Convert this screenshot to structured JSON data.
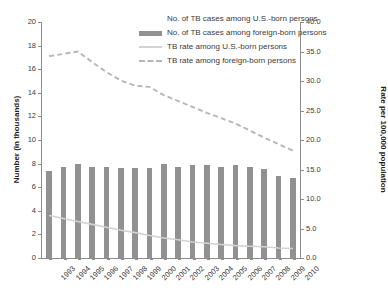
{
  "chart_data": {
    "type": "bar",
    "title": "",
    "subtitle": "",
    "xlabel": "",
    "ylabel": "Number (in thousands)",
    "y2label": "Rate per 100,000 population",
    "ylim": [
      0,
      20
    ],
    "y2lim": [
      0,
      40
    ],
    "grid": false,
    "legend_position": "top-right",
    "categories": [
      "1993",
      "1994",
      "1995",
      "1996",
      "1997",
      "1998",
      "1999",
      "2000",
      "2001",
      "2002",
      "2003",
      "2004",
      "2005",
      "2006",
      "2007",
      "2008",
      "2009",
      "2010"
    ],
    "yticks": [
      "0",
      "2",
      "4",
      "6",
      "8",
      "10",
      "12",
      "14",
      "16",
      "18",
      "20"
    ],
    "y2ticks": [
      "0.0",
      "5.0",
      "10.0",
      "15.0",
      "20.0",
      "25.0",
      "30.0",
      "35.0",
      "40.0"
    ],
    "series": [
      {
        "name": "No. of TB cases among U.S.-born persons",
        "type": "bar",
        "axis": "left",
        "color": "#ffffff",
        "visible_in_plot": false,
        "values": [
          null,
          null,
          null,
          null,
          null,
          null,
          null,
          null,
          null,
          null,
          null,
          null,
          null,
          null,
          null,
          null,
          null,
          null
        ]
      },
      {
        "name": "No. of TB cases among foreign-born persons",
        "type": "bar",
        "axis": "left",
        "color": "#919191",
        "values": [
          7.4,
          7.75,
          8.0,
          7.75,
          7.75,
          7.6,
          7.6,
          7.6,
          8.0,
          7.75,
          7.9,
          7.85,
          7.75,
          7.85,
          7.75,
          7.55,
          6.95,
          6.75
        ]
      },
      {
        "name": "TB rate among U.S.-born persons",
        "type": "line",
        "axis": "right",
        "color": "#d3d3d3",
        "style": "solid",
        "values": [
          7.2,
          6.7,
          6.2,
          5.7,
          5.2,
          4.7,
          4.3,
          3.8,
          3.4,
          3.1,
          2.7,
          2.5,
          2.3,
          2.1,
          2.0,
          1.9,
          1.7,
          1.6
        ]
      },
      {
        "name": "TB rate among foreign-born persons",
        "type": "line",
        "axis": "right",
        "color": "#b6b6b6",
        "style": "dashed",
        "values": [
          34.2,
          34.6,
          35.0,
          33.2,
          31.5,
          30.1,
          29.2,
          29.0,
          27.6,
          26.6,
          25.6,
          24.6,
          23.7,
          22.8,
          21.6,
          20.4,
          19.3,
          18.2
        ]
      }
    ]
  },
  "legend": {
    "items": [
      {
        "label": "No. of TB cases among U.S.-born persons",
        "marker": "none"
      },
      {
        "label": "No. of TB cases among foreign-born persons",
        "marker": "swatch"
      },
      {
        "label": "TB rate among U.S.-born persons",
        "marker": "solidline"
      },
      {
        "label": "TB rate among foreign-born persons",
        "marker": "dashline"
      }
    ]
  }
}
